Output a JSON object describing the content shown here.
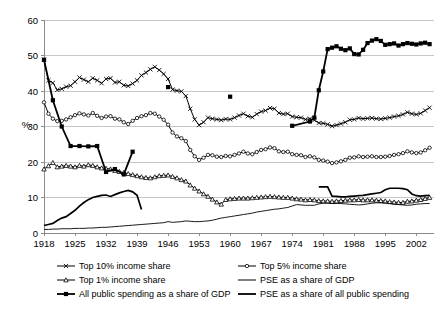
{
  "chart_data": {
    "type": "line",
    "title": "",
    "xlabel": "",
    "ylabel": "%",
    "xlim": [
      1918,
      2006
    ],
    "ylim": [
      0,
      60
    ],
    "ytick_step": 10,
    "yticks": [
      0,
      10,
      20,
      30,
      40,
      50,
      60
    ],
    "xticks": [
      1918,
      1925,
      1932,
      1939,
      1946,
      1953,
      1960,
      1967,
      1974,
      1981,
      1988,
      1995,
      2002
    ],
    "grid": "horizontal",
    "legend_position": "bottom",
    "colors": {
      "line": "#000000",
      "grid": "#b8b8b8",
      "axis": "#808080",
      "background": "#ffffff"
    },
    "series": [
      {
        "name": "Top 10% income share",
        "marker": "x",
        "line_width": 1.0,
        "x": [
          1918,
          1919,
          1920,
          1921,
          1922,
          1923,
          1924,
          1925,
          1926,
          1927,
          1928,
          1929,
          1930,
          1931,
          1932,
          1933,
          1934,
          1935,
          1936,
          1937,
          1938,
          1939,
          1940,
          1941,
          1942,
          1943,
          1944,
          1945,
          1946,
          1947,
          1948,
          1949,
          1950,
          1951,
          1952,
          1953,
          1954,
          1955,
          1956,
          1957,
          1958,
          1959,
          1960,
          1961,
          1962,
          1963,
          1964,
          1965,
          1966,
          1967,
          1968,
          1969,
          1970,
          1971,
          1972,
          1973,
          1974,
          1975,
          1976,
          1977,
          1978,
          1979,
          1980,
          1981,
          1982,
          1983,
          1984,
          1985,
          1986,
          1987,
          1988,
          1989,
          1990,
          1991,
          1992,
          1993,
          1994,
          1995,
          1996,
          1997,
          1998,
          1999,
          2000,
          2001,
          2002,
          2003,
          2004,
          2005
        ],
        "y": [
          48.8,
          43.0,
          42.3,
          40.3,
          40.6,
          41.2,
          41.5,
          42.6,
          43.8,
          43.2,
          42.6,
          43.6,
          43.0,
          42.2,
          43.4,
          43.6,
          42.4,
          42.6,
          41.6,
          41.4,
          42.1,
          43.0,
          44.4,
          45.2,
          46.1,
          46.8,
          45.9,
          44.8,
          43.4,
          40.4,
          40.1,
          39.9,
          38.6,
          35.0,
          32.0,
          30.4,
          31.2,
          32.5,
          32.2,
          32.0,
          31.8,
          32.1,
          32.0,
          32.5,
          33.1,
          33.6,
          32.9,
          32.6,
          33.5,
          34.2,
          34.5,
          35.2,
          35.0,
          33.8,
          33.5,
          33.6,
          32.8,
          32.6,
          32.5,
          32.0,
          32.2,
          31.8,
          31.0,
          30.9,
          30.6,
          30.1,
          30.4,
          30.8,
          31.2,
          31.9,
          32.0,
          32.4,
          32.2,
          32.3,
          32.4,
          32.2,
          32.1,
          32.3,
          32.5,
          32.8,
          33.0,
          33.4,
          34.0,
          33.6,
          33.4,
          33.7,
          34.5,
          35.3
        ]
      },
      {
        "name": "Top 5% income share",
        "marker": "o",
        "line_width": 1.0,
        "x": [
          1918,
          1919,
          1920,
          1921,
          1922,
          1923,
          1924,
          1925,
          1926,
          1927,
          1928,
          1929,
          1930,
          1931,
          1932,
          1933,
          1934,
          1935,
          1936,
          1937,
          1938,
          1939,
          1940,
          1941,
          1942,
          1943,
          1944,
          1945,
          1946,
          1947,
          1948,
          1949,
          1950,
          1951,
          1952,
          1953,
          1954,
          1955,
          1956,
          1957,
          1958,
          1959,
          1960,
          1961,
          1962,
          1963,
          1964,
          1965,
          1966,
          1967,
          1968,
          1969,
          1970,
          1971,
          1972,
          1973,
          1974,
          1975,
          1976,
          1977,
          1978,
          1979,
          1980,
          1981,
          1982,
          1983,
          1984,
          1985,
          1986,
          1987,
          1988,
          1989,
          1990,
          1991,
          1992,
          1993,
          1994,
          1995,
          1996,
          1997,
          1998,
          1999,
          2000,
          2001,
          2002,
          2003,
          2004,
          2005
        ],
        "y": [
          36.8,
          33.6,
          32.2,
          31.5,
          31.6,
          32.0,
          32.6,
          33.2,
          33.7,
          33.4,
          33.1,
          33.8,
          33.0,
          32.4,
          32.8,
          32.9,
          32.2,
          32.0,
          31.2,
          30.7,
          31.6,
          32.4,
          32.9,
          33.2,
          33.8,
          33.6,
          32.8,
          31.9,
          30.5,
          28.3,
          27.2,
          26.7,
          25.9,
          23.4,
          21.6,
          20.6,
          21.2,
          22.0,
          21.9,
          21.5,
          21.4,
          21.7,
          21.6,
          22.0,
          22.4,
          22.9,
          22.4,
          22.2,
          22.8,
          23.4,
          23.6,
          24.1,
          23.9,
          23.0,
          22.8,
          22.9,
          22.2,
          22.0,
          21.9,
          21.4,
          21.6,
          21.3,
          20.6,
          20.4,
          20.1,
          19.7,
          19.9,
          20.2,
          20.6,
          21.2,
          21.3,
          21.6,
          21.4,
          21.5,
          21.6,
          21.4,
          21.4,
          21.5,
          21.7,
          22.0,
          22.2,
          22.5,
          23.0,
          22.7,
          22.5,
          22.7,
          23.3,
          24.0
        ]
      },
      {
        "name": "Top 1% income share",
        "marker": "triangle",
        "line_width": 1.0,
        "x": [
          1918,
          1919,
          1920,
          1921,
          1922,
          1923,
          1924,
          1925,
          1926,
          1927,
          1928,
          1929,
          1930,
          1931,
          1932,
          1933,
          1934,
          1935,
          1936,
          1937,
          1938,
          1939,
          1940,
          1941,
          1942,
          1943,
          1944,
          1945,
          1946,
          1947,
          1948,
          1949,
          1950,
          1951,
          1952,
          1953,
          1954,
          1955,
          1956,
          1957,
          1958,
          1959,
          1960,
          1961,
          1962,
          1963,
          1964,
          1965,
          1966,
          1967,
          1968,
          1969,
          1970,
          1971,
          1972,
          1973,
          1974,
          1975,
          1976,
          1977,
          1978,
          1979,
          1980,
          1981,
          1982,
          1983,
          1984,
          1985,
          1986,
          1987,
          1988,
          1989,
          1990,
          1991,
          1992,
          1993,
          1994,
          1995,
          1996,
          1997,
          1998,
          1999,
          2000,
          2001,
          2002,
          2003,
          2004,
          2005
        ],
        "y": [
          18.0,
          18.9,
          19.8,
          18.6,
          18.8,
          19.0,
          18.8,
          18.6,
          19.0,
          18.8,
          19.2,
          19.0,
          18.6,
          18.3,
          18.2,
          18.0,
          17.6,
          17.3,
          17.0,
          16.7,
          16.4,
          16.1,
          15.8,
          15.6,
          15.5,
          15.8,
          16.1,
          16.2,
          16.3,
          15.9,
          15.5,
          15.0,
          14.6,
          13.5,
          12.6,
          11.8,
          11.0,
          10.3,
          9.5,
          8.7,
          8.1,
          9.4,
          9.6,
          9.7,
          9.8,
          9.8,
          9.8,
          9.9,
          10.0,
          10.1,
          10.2,
          10.3,
          10.2,
          10.1,
          10.0,
          10.0,
          9.8,
          9.6,
          9.5,
          9.3,
          9.4,
          9.3,
          9.1,
          9.0,
          9.0,
          8.9,
          9.0,
          9.1,
          9.2,
          9.3,
          9.3,
          9.4,
          9.3,
          9.3,
          9.3,
          9.2,
          9.1,
          9.0,
          8.8,
          8.7,
          8.6,
          8.6,
          8.9,
          9.0,
          9.2,
          9.4,
          9.7,
          10.0
        ]
      },
      {
        "name": "All public spending as a share of GDP",
        "marker": "square-filled",
        "line_width": 1.8,
        "x": [
          1918,
          1920,
          1922,
          1924,
          1926,
          1928,
          1930,
          1932,
          1934,
          1936,
          1938,
          1946,
          1960,
          1974,
          1978,
          1979,
          1980,
          1981,
          1982,
          1983,
          1984,
          1985,
          1986,
          1987,
          1988,
          1989,
          1990,
          1991,
          1992,
          1993,
          1994,
          1995,
          1996,
          1997,
          1998,
          1999,
          2000,
          2001,
          2002,
          2003,
          2004,
          2005
        ],
        "y": [
          48.8,
          37.4,
          30.0,
          24.5,
          24.5,
          24.4,
          24.5,
          17.2,
          18.0,
          16.5,
          22.9,
          41.1,
          38.4,
          30.2,
          31.4,
          32.5,
          40.2,
          45.5,
          51.8,
          52.2,
          52.6,
          51.9,
          51.5,
          52.0,
          50.4,
          50.3,
          51.6,
          53.5,
          54.2,
          54.6,
          54.1,
          53.0,
          53.2,
          53.4,
          52.8,
          53.2,
          53.5,
          53.3,
          53.1,
          53.4,
          53.6,
          53.2
        ]
      },
      {
        "name": "PSE as a share of GDP",
        "marker": "none",
        "line_width": 0.9,
        "x": [
          1918,
          1919,
          1920,
          1921,
          1922,
          1923,
          1924,
          1925,
          1926,
          1927,
          1928,
          1929,
          1930,
          1931,
          1932,
          1933,
          1934,
          1935,
          1936,
          1937,
          1938,
          1939,
          1940,
          1941,
          1942,
          1943,
          1944,
          1945,
          1946,
          1947,
          1948,
          1949,
          1950,
          1951,
          1952,
          1953,
          1954,
          1955,
          1956,
          1957,
          1958,
          1959,
          1960,
          1961,
          1962,
          1963,
          1964,
          1965,
          1966,
          1967,
          1968,
          1969,
          1970,
          1971,
          1972,
          1973,
          1974,
          1975,
          1976,
          1977,
          1978,
          1979,
          1980,
          1981,
          1982,
          1983,
          1984,
          1985,
          1986,
          1987,
          1988,
          1989,
          1990,
          1991,
          1992,
          1993,
          1994,
          1995,
          1996,
          1997,
          1998,
          1999,
          2000,
          2001,
          2002,
          2003,
          2004,
          2005
        ],
        "y": [
          1.0,
          1.0,
          1.1,
          1.1,
          1.2,
          1.2,
          1.2,
          1.3,
          1.3,
          1.3,
          1.4,
          1.4,
          1.5,
          1.6,
          1.6,
          1.7,
          1.8,
          1.9,
          2.0,
          2.1,
          2.2,
          2.3,
          2.4,
          2.5,
          2.6,
          2.7,
          2.8,
          2.9,
          3.2,
          3.0,
          3.1,
          3.2,
          3.4,
          3.3,
          3.2,
          3.2,
          3.3,
          3.4,
          3.6,
          3.9,
          4.2,
          4.4,
          4.6,
          4.8,
          5.0,
          5.2,
          5.4,
          5.6,
          5.9,
          6.1,
          6.3,
          6.5,
          6.7,
          6.8,
          7.0,
          7.2,
          7.6,
          8.0,
          7.9,
          7.8,
          7.8,
          7.8,
          8.2,
          8.4,
          8.4,
          8.3,
          8.3,
          8.3,
          8.2,
          8.1,
          8.0,
          7.9,
          8.0,
          8.2,
          8.4,
          8.5,
          8.5,
          8.4,
          8.3,
          8.1,
          8.0,
          7.9,
          7.8,
          7.9,
          8.1,
          8.2,
          8.3,
          8.3
        ]
      },
      {
        "name": "PSE as a share of all public spending",
        "marker": "none",
        "line_width": 1.7,
        "x": [
          1918,
          1919,
          1920,
          1921,
          1922,
          1923,
          1924,
          1925,
          1926,
          1927,
          1928,
          1929,
          1930,
          1931,
          1932,
          1933,
          1934,
          1935,
          1936,
          1937,
          1938,
          1939,
          1940,
          1980,
          1981,
          1982,
          1983,
          1984,
          1985,
          1986,
          1987,
          1988,
          1989,
          1990,
          1991,
          1992,
          1993,
          1994,
          1995,
          1996,
          1997,
          1998,
          1999,
          2000,
          2001,
          2002,
          2003,
          2004,
          2005
        ],
        "y": [
          2.1,
          2.4,
          2.7,
          3.5,
          4.2,
          4.6,
          5.5,
          6.4,
          7.6,
          8.6,
          9.4,
          10.0,
          10.3,
          10.6,
          10.7,
          10.3,
          10.8,
          11.3,
          11.7,
          12.0,
          11.6,
          10.6,
          6.6,
          13.0,
          13.0,
          13.0,
          10.4,
          10.3,
          10.2,
          10.2,
          10.3,
          10.4,
          10.5,
          10.6,
          10.8,
          11.0,
          11.2,
          11.4,
          12.2,
          12.6,
          12.6,
          12.6,
          12.5,
          12.2,
          11.0,
          10.5,
          10.4,
          10.5,
          10.6
        ]
      }
    ]
  },
  "legend": {
    "items": [
      {
        "label": "Top 10% income share",
        "marker": "x",
        "thick": false
      },
      {
        "label": "Top 5% income share",
        "marker": "o",
        "thick": false
      },
      {
        "label": "Top 1% income share",
        "marker": "triangle",
        "thick": false
      },
      {
        "label": "PSE as a share of GDP",
        "marker": "none",
        "thick": false
      },
      {
        "label": "All public spending as a share of GDP",
        "marker": "square-filled",
        "thick": true
      },
      {
        "label": "PSE as a share of all public spending",
        "marker": "none",
        "thick": true
      }
    ]
  }
}
